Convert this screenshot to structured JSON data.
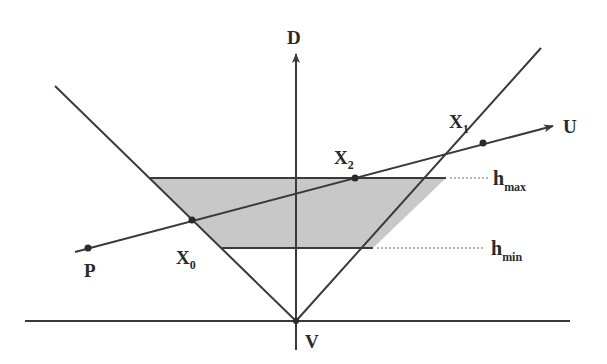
{
  "diagram": {
    "colors": {
      "line": "#3a3a3a",
      "fill": "#c8c8c8",
      "dotted": "#6a6a6a",
      "text": "#2a2a2a"
    },
    "axis_label": "D",
    "vertex_label": "V",
    "ray_start_label": "P",
    "ray_end_label": "U",
    "points": {
      "x0": {
        "base": "X",
        "sub": "0"
      },
      "x1": {
        "base": "X",
        "sub": "1"
      },
      "x2": {
        "base": "X",
        "sub": "2"
      }
    },
    "levels": {
      "hmax": {
        "base": "h",
        "sub": "max"
      },
      "hmin": {
        "base": "h",
        "sub": "min"
      }
    }
  }
}
